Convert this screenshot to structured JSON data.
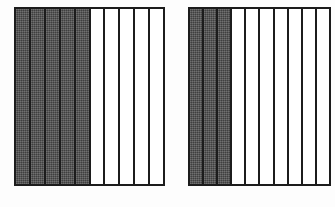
{
  "figure": {
    "background_color": "#fdfdfd",
    "shaded_color": "#4e4e4e",
    "unshaded_color": "#ffffff",
    "outline_color": "#1c1c1c"
  },
  "chart_data": {
    "type": "bar",
    "xlabel": "",
    "ylabel": "",
    "categories": [
      "Left bar",
      "Right bar"
    ],
    "series": [
      {
        "name": "Shaded parts",
        "values": [
          5,
          3
        ]
      },
      {
        "name": "Unshaded parts",
        "values": [
          5,
          7
        ]
      },
      {
        "name": "Total parts",
        "values": [
          10,
          10
        ]
      }
    ],
    "grid": false,
    "legend": "none"
  },
  "bars": [
    {
      "id": "left-bar",
      "total_parts": 10,
      "shaded_parts": 5,
      "unshaded_parts": 5,
      "fraction": "5/10",
      "strips": [
        {
          "index": 1,
          "shaded": true
        },
        {
          "index": 2,
          "shaded": true
        },
        {
          "index": 3,
          "shaded": true
        },
        {
          "index": 4,
          "shaded": true
        },
        {
          "index": 5,
          "shaded": true
        },
        {
          "index": 6,
          "shaded": false
        },
        {
          "index": 7,
          "shaded": false
        },
        {
          "index": 8,
          "shaded": false
        },
        {
          "index": 9,
          "shaded": false
        },
        {
          "index": 10,
          "shaded": false
        }
      ]
    },
    {
      "id": "right-bar",
      "total_parts": 10,
      "shaded_parts": 3,
      "unshaded_parts": 7,
      "fraction": "3/10",
      "strips": [
        {
          "index": 1,
          "shaded": true
        },
        {
          "index": 2,
          "shaded": true
        },
        {
          "index": 3,
          "shaded": true
        },
        {
          "index": 4,
          "shaded": false
        },
        {
          "index": 5,
          "shaded": false
        },
        {
          "index": 6,
          "shaded": false
        },
        {
          "index": 7,
          "shaded": false
        },
        {
          "index": 8,
          "shaded": false
        },
        {
          "index": 9,
          "shaded": false
        },
        {
          "index": 10,
          "shaded": false
        }
      ]
    }
  ]
}
